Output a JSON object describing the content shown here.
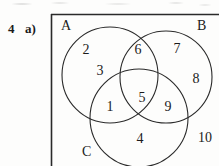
{
  "exercise": {
    "number": "4",
    "part": "a)"
  },
  "figure": {
    "type": "venn-diagram",
    "universal_set_border": true,
    "stroke_color": "#2a2a2a",
    "background_color": "#fdfdfc",
    "set_labels": [
      {
        "name": "set-label-a",
        "text": "A",
        "x": 62,
        "y": 20
      },
      {
        "name": "set-label-b",
        "text": "B",
        "x": 198,
        "y": 20
      },
      {
        "name": "set-label-c",
        "text": "C",
        "x": 83,
        "y": 146
      }
    ],
    "circles": [
      {
        "name": "circle-a",
        "label": "A",
        "cx": 110,
        "cy": 75,
        "r": 48
      },
      {
        "name": "circle-b",
        "label": "B",
        "cx": 166,
        "cy": 77,
        "r": 46
      },
      {
        "name": "circle-c",
        "label": "C",
        "cx": 139,
        "cy": 118,
        "r": 49
      }
    ],
    "elements": [
      {
        "name": "element-2",
        "text": "2",
        "x": 86,
        "y": 50,
        "region": "A only"
      },
      {
        "name": "element-3",
        "text": "3",
        "x": 100,
        "y": 71,
        "region": "A only"
      },
      {
        "name": "element-6",
        "text": "6",
        "x": 138,
        "y": 50,
        "region": "A and B"
      },
      {
        "name": "element-7",
        "text": "7",
        "x": 177,
        "y": 49,
        "region": "B only"
      },
      {
        "name": "element-8",
        "text": "8",
        "x": 196,
        "y": 79,
        "region": "B only"
      },
      {
        "name": "element-5",
        "text": "5",
        "x": 142,
        "y": 98,
        "region": "A and B and C"
      },
      {
        "name": "element-1",
        "text": "1",
        "x": 110,
        "y": 107,
        "region": "A and C"
      },
      {
        "name": "element-9",
        "text": "9",
        "x": 168,
        "y": 107,
        "region": "B and C"
      },
      {
        "name": "element-4",
        "text": "4",
        "x": 140,
        "y": 139,
        "region": "C only"
      },
      {
        "name": "element-10",
        "text": "10",
        "x": 205,
        "y": 138,
        "region": "outside all sets"
      }
    ]
  }
}
